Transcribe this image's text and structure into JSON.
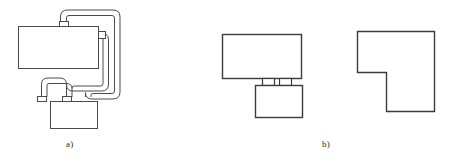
{
  "figure": {
    "type": "technical-line-drawing",
    "background_color": "#ffffff",
    "stroke_color": "#4a4a4a",
    "stroke_color_dark": "#3a3a3a",
    "fill_color": "#ffffff",
    "line_width": 1,
    "labels": {
      "part_a": "a)",
      "part_b": "b)"
    },
    "panels": [
      {
        "id": "panel-a",
        "label": "a)",
        "description": "Appliance body with two looping double-wall hoses connecting to a base unit",
        "components": [
          {
            "name": "main-body-rectangle",
            "shape": "rectangle",
            "x": 18,
            "y": 26,
            "width": 80,
            "height": 42
          },
          {
            "name": "top-port-connector",
            "shape": "rectangle",
            "x": 59,
            "y": 21,
            "width": 9,
            "height": 5
          },
          {
            "name": "right-port-connector",
            "shape": "rectangle",
            "x": 98,
            "y": 31,
            "width": 7,
            "height": 7
          },
          {
            "name": "base-unit-rectangle",
            "shape": "rectangle",
            "x": 50,
            "y": 101,
            "width": 47,
            "height": 27
          },
          {
            "name": "base-left-port-connector",
            "shape": "rectangle",
            "x": 58,
            "y": 96,
            "width": 9,
            "height": 5
          },
          {
            "name": "base-right-port-connector",
            "shape": "rectangle",
            "x": 77,
            "y": 96,
            "width": 9,
            "height": 5
          },
          {
            "name": "hose-outer",
            "shape": "double-line-tube",
            "from": "top-port-connector",
            "to": "base-right-port-connector"
          },
          {
            "name": "hose-inner",
            "shape": "double-line-tube",
            "from": "right-port-connector",
            "to": "base-left-port-connector"
          }
        ]
      },
      {
        "id": "panel-b-front-view",
        "label": "b)",
        "description": "Front elevation: upper housing over lower base joined by two spacer blocks",
        "components": [
          {
            "name": "upper-housing-rectangle",
            "shape": "rectangle",
            "x": 222,
            "y": 34,
            "width": 79,
            "height": 44
          },
          {
            "name": "spacer-block-left",
            "shape": "rectangle",
            "x": 262,
            "y": 78,
            "width": 12,
            "height": 7
          },
          {
            "name": "spacer-block-right",
            "shape": "rectangle",
            "x": 279,
            "y": 78,
            "width": 12,
            "height": 7
          },
          {
            "name": "lower-base-rectangle",
            "shape": "rectangle",
            "x": 255,
            "y": 85,
            "width": 47,
            "height": 32
          }
        ]
      },
      {
        "id": "panel-b-side-view",
        "label": "b)",
        "description": "Side elevation: notched L-shaped profile",
        "components": [
          {
            "name": "notched-profile-outline",
            "shape": "polygon",
            "points": "357,31 434,31 434,111 386,111 386,72 357,72"
          }
        ]
      }
    ]
  }
}
